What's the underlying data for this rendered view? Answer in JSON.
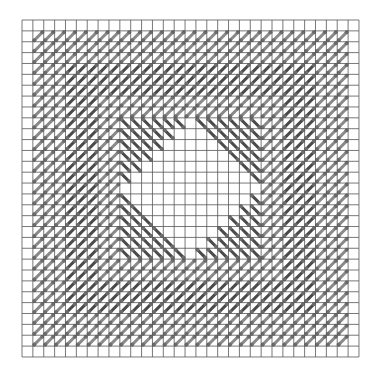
{
  "diagram": {
    "type": "stitch-pattern-grid",
    "grid": {
      "columns": 31,
      "rows": 31
    },
    "colors": {
      "grid_line": "#555555",
      "light_stitch": "#8a8a8a",
      "dark_stitch": "#4a4a4a",
      "knot": "#6e6e6e",
      "background": "#ffffff"
    },
    "bands": [
      {
        "name": "outer-light-band",
        "ring_from": 1,
        "ring_to": 3,
        "direction": "forward",
        "shade": "light"
      },
      {
        "name": "dark-band",
        "ring_from": 4,
        "ring_to": 6,
        "direction": "forward",
        "shade": "dark"
      },
      {
        "name": "middle-light-band",
        "ring_from": 7,
        "ring_to": 8,
        "direction": "forward",
        "shade": "light"
      },
      {
        "name": "inner-square",
        "ring_from": 9,
        "ring_to": 15,
        "direction": "backward",
        "shade": "dark"
      }
    ],
    "center_hole": {
      "shape": "diamond",
      "radius_cells": 7
    }
  }
}
